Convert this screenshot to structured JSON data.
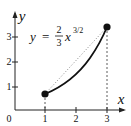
{
  "diagram": {
    "equation": {
      "lhs": "y",
      "eq": "=",
      "num": "2",
      "den": "3",
      "var": "x",
      "exponent": "3/2"
    },
    "axes": {
      "x_label": "x",
      "y_label": "y",
      "origin_label": "0",
      "x_ticks": [
        "1",
        "2",
        "3"
      ],
      "y_ticks": [
        "1",
        "2",
        "3"
      ]
    },
    "endpoints": [
      {
        "x": 1,
        "y": 0.667
      },
      {
        "x": 3,
        "y": 3.464
      }
    ],
    "colors": {
      "ink": "#111111",
      "chord": "#777777"
    }
  }
}
